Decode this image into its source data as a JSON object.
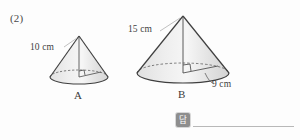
{
  "problem": {
    "number": "(2)"
  },
  "figures": [
    {
      "name": "A",
      "name_label": "A",
      "slant_label": "10 cm",
      "slant_value": 10,
      "unit": "cm",
      "shape": "cone",
      "geometry": {
        "apex_x": 79,
        "apex_y": 36,
        "base_cx": 79,
        "base_cy": 77,
        "base_rx": 29,
        "base_ry": 7
      }
    },
    {
      "name": "B",
      "name_label": "B",
      "slant_label": "15 cm",
      "slant_value": 15,
      "radius_label": "9 cm",
      "radius_value": 9,
      "unit": "cm",
      "shape": "cone",
      "geometry": {
        "apex_x": 183,
        "apex_y": 16,
        "base_cx": 183,
        "base_cy": 73,
        "base_rx": 46,
        "base_ry": 10
      }
    }
  ],
  "answer": {
    "icon_glyph": "답",
    "icon_name": "answer-badge-icon",
    "line_value": ""
  },
  "colors": {
    "outline": "#3f3f3f",
    "fill_light": "#f2f2f2",
    "fill_mid": "#e4e4e4",
    "fill_dark": "#d5d5d5",
    "leader": "#b0b0b0",
    "dashed": "#5a5a5a",
    "text": "#3d3d3d",
    "icon_bg": "#8e8e8e",
    "answer_line": "#b8b8b8"
  }
}
